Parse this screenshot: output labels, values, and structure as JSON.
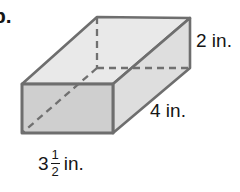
{
  "figure": {
    "item_letter": "b.",
    "shape_name": "rectangular-prism",
    "labels": {
      "height": "2 in.",
      "depth": "4 in.",
      "width_whole": "3",
      "width_numerator": "1",
      "width_denominator": "2",
      "width_unit": "in."
    },
    "colors": {
      "background": "#ffffff",
      "edge_stroke": "#6e6e6e",
      "front_face_fill": "#cfcfcf",
      "top_face_fill": "#e9e9e9",
      "side_face_fill": "#dedede",
      "hidden_edge_stroke": "#707070",
      "text": "#161616"
    },
    "geometry": {
      "front_top_left": [
        22,
        84
      ],
      "front_top_right": [
        113,
        84
      ],
      "front_bottom_right": [
        113,
        133
      ],
      "front_bottom_left": [
        22,
        133
      ],
      "back_top_left": [
        97,
        17
      ],
      "back_top_right": [
        190,
        18
      ],
      "back_bottom_right": [
        190,
        68
      ],
      "back_bottom_left_hidden": [
        97,
        68
      ]
    }
  }
}
